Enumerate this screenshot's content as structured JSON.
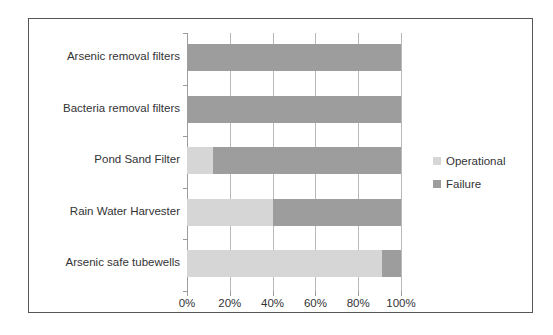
{
  "chart_data": {
    "type": "bar",
    "orientation": "horizontal",
    "stacked": true,
    "normalized_percent": true,
    "title": "",
    "subtitle": "",
    "xlabel": "",
    "ylabel": "",
    "categories": [
      "Arsenic removal filters",
      "Bacteria removal filters",
      "Pond Sand Filter",
      "Rain Water Harvester",
      "Arsenic safe tubewells"
    ],
    "series": [
      {
        "name": "Operational",
        "color": "#d6d6d6",
        "values": [
          0,
          0,
          12,
          40,
          91
        ]
      },
      {
        "name": "Failure",
        "color": "#9d9d9d",
        "values": [
          100,
          100,
          88,
          60,
          9
        ]
      }
    ],
    "xlim": [
      0,
      100
    ],
    "xticks": [
      0,
      20,
      40,
      60,
      80,
      100
    ],
    "xtick_labels": [
      "0%",
      "20%",
      "40%",
      "60%",
      "80%",
      "100%"
    ],
    "grid": "vertical",
    "legend_position": "right",
    "legend_entries": [
      "Operational",
      "Failure"
    ]
  },
  "figure": {
    "border_color": "#55565a",
    "background": "#ffffff"
  }
}
